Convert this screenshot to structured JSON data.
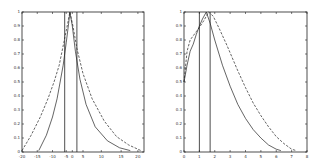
{
  "chart_data": [
    {
      "type": "line",
      "title": "",
      "xlabel": "",
      "ylabel": "",
      "xlim": [
        -20,
        20
      ],
      "ylim": [
        0,
        1
      ],
      "grid": false,
      "legend": null,
      "x_ticks": [
        {
          "label": "-20",
          "value": -20
        },
        {
          "label": "-15",
          "value": -15
        },
        {
          "label": "-10",
          "value": -10
        },
        {
          "label": "-5",
          "value": -5.5
        },
        {
          "label": "0",
          "value": -3.5
        },
        {
          "label": "5",
          "value": 0
        },
        {
          "label": "10",
          "value": 6
        },
        {
          "label": "15",
          "value": 12.5
        },
        {
          "label": "20",
          "value": 18
        }
      ],
      "y_ticks": [
        "0",
        "0.1",
        "0.2",
        "0.3",
        "0.4",
        "0.5",
        "0.6",
        "0.7",
        "0.8",
        "0.9",
        "1"
      ],
      "vertical_lines": [
        -6,
        -2
      ],
      "series": [
        {
          "name": "solid",
          "style": "solid",
          "x": [
            -14.5,
            -12,
            -10,
            -8.5,
            -7.5,
            -6.5,
            -5.5,
            -4.7,
            -4.3,
            -3.5,
            -2.5,
            -1,
            1,
            4,
            8,
            12,
            15.5
          ],
          "y": [
            0.01,
            0.12,
            0.25,
            0.38,
            0.5,
            0.62,
            0.78,
            0.92,
            1.0,
            0.9,
            0.72,
            0.52,
            0.34,
            0.18,
            0.08,
            0.03,
            0.01
          ]
        },
        {
          "name": "dashed",
          "style": "dashed",
          "x": [
            -20,
            -17,
            -14,
            -11.5,
            -9.5,
            -7.8,
            -6.3,
            -5,
            -4.3,
            -3.3,
            -2,
            0,
            3,
            7,
            11,
            15,
            19
          ],
          "y": [
            0.01,
            0.12,
            0.25,
            0.38,
            0.5,
            0.62,
            0.78,
            0.92,
            1.0,
            0.9,
            0.74,
            0.56,
            0.38,
            0.22,
            0.11,
            0.05,
            0.01
          ]
        }
      ]
    },
    {
      "type": "line",
      "title": "",
      "xlabel": "",
      "ylabel": "",
      "xlim": [
        0,
        8
      ],
      "ylim": [
        0,
        1
      ],
      "grid": false,
      "legend": null,
      "x_ticks": [
        "0",
        "1",
        "2",
        "3",
        "4",
        "5",
        "6",
        "7",
        "8"
      ],
      "y_ticks": [
        "0",
        "0.1",
        "0.2",
        "0.3",
        "0.4",
        "0.5",
        "0.6",
        "0.7",
        "0.8",
        "0.9",
        "1"
      ],
      "vertical_lines": [
        1.0,
        1.7
      ],
      "series": [
        {
          "name": "solid",
          "style": "solid",
          "x": [
            0,
            0.2,
            0.4,
            0.6,
            0.8,
            1.0,
            1.2,
            1.45,
            1.7,
            2.0,
            2.5,
            3.0,
            3.5,
            4.0,
            4.5,
            5.0,
            5.5,
            6.0,
            6.3
          ],
          "y": [
            0.5,
            0.62,
            0.72,
            0.77,
            0.84,
            0.9,
            0.95,
            1.0,
            0.92,
            0.8,
            0.62,
            0.47,
            0.34,
            0.24,
            0.16,
            0.1,
            0.05,
            0.02,
            0.01
          ]
        },
        {
          "name": "dashed",
          "style": "dashed",
          "x": [
            0,
            0.2,
            0.4,
            0.6,
            0.8,
            1.0,
            1.3,
            1.6,
            1.9,
            2.3,
            2.8,
            3.5,
            4.0,
            4.5,
            5.0,
            5.5,
            6.0,
            6.5,
            7.0,
            7.3
          ],
          "y": [
            0.5,
            0.72,
            0.8,
            0.83,
            0.86,
            0.89,
            0.94,
            1.0,
            0.97,
            0.88,
            0.76,
            0.58,
            0.46,
            0.35,
            0.26,
            0.18,
            0.11,
            0.06,
            0.02,
            0.01
          ]
        }
      ]
    }
  ]
}
